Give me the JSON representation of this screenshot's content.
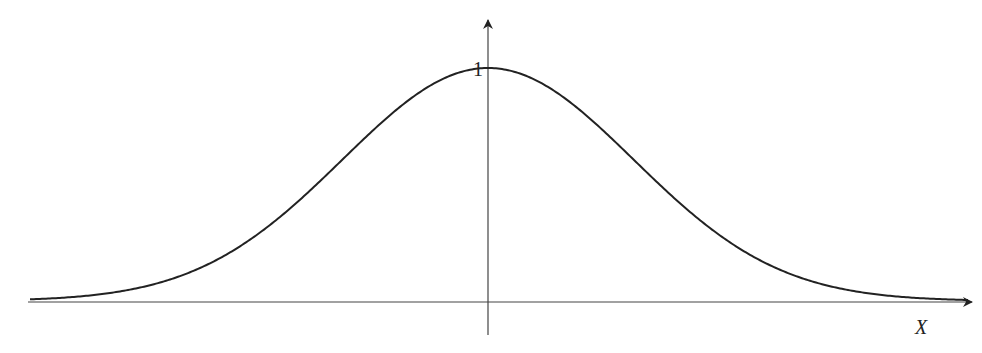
{
  "chart_data": {
    "type": "line",
    "title": "",
    "function": "exp(-x^2)",
    "xlabel": "X",
    "ylabel": "",
    "ytick_labels": [
      "1"
    ],
    "xlim": [
      -2.2,
      2.25
    ],
    "ylim": [
      0,
      1
    ],
    "grid": false,
    "legend": null,
    "series": [
      {
        "name": "gaussian-curve",
        "x": [
          -2.2,
          -2.0,
          -1.8,
          -1.6,
          -1.4,
          -1.2,
          -1.0,
          -0.8,
          -0.6,
          -0.4,
          -0.2,
          0,
          0.2,
          0.4,
          0.6,
          0.8,
          1.0,
          1.2,
          1.4,
          1.6,
          1.8,
          2.0,
          2.2
        ],
        "values": [
          0.008,
          0.018,
          0.039,
          0.077,
          0.141,
          0.237,
          0.368,
          0.527,
          0.698,
          0.852,
          0.961,
          1.0,
          0.961,
          0.852,
          0.698,
          0.527,
          0.368,
          0.237,
          0.141,
          0.077,
          0.039,
          0.018,
          0.008
        ]
      }
    ]
  },
  "labels": {
    "x_axis": "X",
    "peak": "1"
  }
}
